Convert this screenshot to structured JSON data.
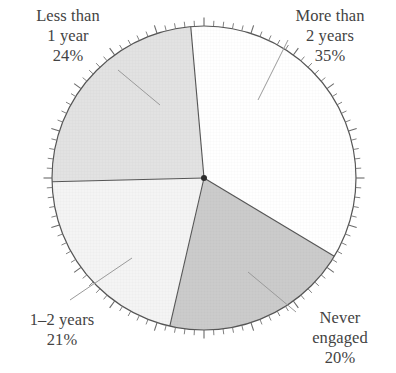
{
  "chart_data": {
    "type": "pie",
    "title": "",
    "subtitle": "",
    "xlabel": "",
    "ylabel": "",
    "legend_position": "none",
    "grid": false,
    "units": "percent",
    "total": 100,
    "center": {
      "x": 204,
      "y": 178
    },
    "radius": 152,
    "tick_count": 100,
    "categories": [
      "More than 2 years",
      "Never engaged",
      "1–2 years",
      "Less than 1 year"
    ],
    "values": [
      35,
      20,
      21,
      24
    ],
    "slices": [
      {
        "label_line1": "More than",
        "label_line2": "2 years",
        "value_text": "35%",
        "value": 35,
        "fill": "#ffffff",
        "start_angle": 355,
        "end_angle": 481
      },
      {
        "label_line1": "Never",
        "label_line2": "engaged",
        "value_text": "20%",
        "value": 20,
        "fill": "#cbcbcb",
        "start_angle": 121,
        "end_angle": 193
      },
      {
        "label_line1": "1–2 years",
        "label_line2": "",
        "value_text": "21%",
        "value": 21,
        "fill": "#f4f4f4",
        "start_angle": 193,
        "end_angle": 268.6
      },
      {
        "label_line1": "Less than",
        "label_line2": "1 year",
        "value_text": "24%",
        "value": 24,
        "fill": "#e2e2e2",
        "start_angle": 268.6,
        "end_angle": 355
      }
    ]
  },
  "colors": {
    "outline": "#555555",
    "tick": "#6a6a6a",
    "leader": "#9a9a9a",
    "text": "#434343",
    "background": "#ffffff",
    "slice_more_than_2_years": "#ffffff",
    "slice_never_engaged": "#cbcbcb",
    "slice_1_2_years": "#f4f4f4",
    "slice_less_than_1_year": "#e2e2e2"
  },
  "labels": {
    "less_than_1_year": {
      "line1": "Less than",
      "line2": "1 year",
      "percent": "24%"
    },
    "more_than_2_years": {
      "line1": "More than",
      "line2": "2 years",
      "percent": "35%"
    },
    "one_to_two_years": {
      "line1": "1–2 years",
      "percent": "21%"
    },
    "never_engaged": {
      "line1": "Never",
      "line2": "engaged",
      "percent": "20%"
    }
  }
}
